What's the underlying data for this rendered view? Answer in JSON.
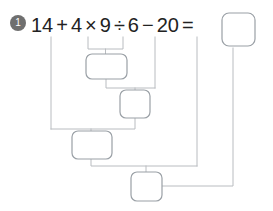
{
  "problem": {
    "number_badge": "1",
    "expression_tokens": [
      {
        "text": "14",
        "kind": "number"
      },
      {
        "text": "+",
        "kind": "operator"
      },
      {
        "text": "4",
        "kind": "number"
      },
      {
        "text": "×",
        "kind": "operator"
      },
      {
        "text": "9",
        "kind": "number"
      },
      {
        "text": "÷",
        "kind": "operator"
      },
      {
        "text": "6",
        "kind": "number"
      },
      {
        "text": "−",
        "kind": "operator"
      },
      {
        "text": "20",
        "kind": "number"
      },
      {
        "text": "=",
        "kind": "operator"
      }
    ],
    "expression_text": "14 + 4 × 9 ÷ 6 − 20 ="
  },
  "answer_box": {
    "value": "",
    "placeholder": ""
  },
  "step_boxes": [
    {
      "id": "step-1",
      "value": "",
      "placeholder": "",
      "operation": "4 × 9"
    },
    {
      "id": "step-2",
      "value": "",
      "placeholder": "",
      "operation": "step-1 ÷ 6"
    },
    {
      "id": "step-3",
      "value": "",
      "placeholder": "",
      "operation": "14 + step-2"
    },
    {
      "id": "step-4",
      "value": "",
      "placeholder": "",
      "operation": "step-3 − 20"
    }
  ],
  "colors": {
    "line": "#b9bcc0",
    "box_border": "#9aa0a6",
    "badge_bg": "#6f6f6f",
    "badge_text": "#ffffff",
    "text": "#222222",
    "background": "#ffffff"
  }
}
